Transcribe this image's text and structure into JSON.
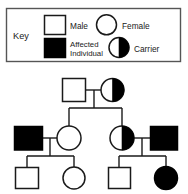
{
  "figure": {
    "type": "pedigree-chart",
    "title": "",
    "background_color": "#ffffff",
    "line_color": "#1a1a1a",
    "fill_affected_color": "#000000",
    "fill_unaffected_color": "#ffffff"
  },
  "key": {
    "label": "Key",
    "border_color": "#555555",
    "entries": [
      {
        "id": "male",
        "label": "Male",
        "symbol": "square",
        "fill": "none"
      },
      {
        "id": "female",
        "label": "Female",
        "symbol": "circle",
        "fill": "none"
      },
      {
        "id": "affected",
        "label_line1": "Affected",
        "label_line2": "Individual",
        "label": "Affected Individual",
        "symbol": "square",
        "fill": "full"
      },
      {
        "id": "carrier",
        "label": "Carrier",
        "symbol": "circle",
        "fill": "half-right"
      }
    ]
  },
  "pedigree": {
    "generations": [
      {
        "id": "I",
        "individuals": [
          {
            "id": "I-1",
            "sex": "male",
            "status": "unaffected",
            "symbol": "square",
            "fill": "none"
          },
          {
            "id": "I-2",
            "sex": "female",
            "status": "carrier",
            "symbol": "circle",
            "fill": "half-right"
          }
        ]
      },
      {
        "id": "II",
        "individuals": [
          {
            "id": "II-1",
            "sex": "male",
            "status": "affected",
            "symbol": "square",
            "fill": "full"
          },
          {
            "id": "II-2",
            "sex": "female",
            "status": "unaffected",
            "symbol": "circle",
            "fill": "none"
          },
          {
            "id": "II-3",
            "sex": "female",
            "status": "carrier",
            "symbol": "circle",
            "fill": "half-right"
          },
          {
            "id": "II-4",
            "sex": "male",
            "status": "affected",
            "symbol": "square",
            "fill": "full"
          }
        ]
      },
      {
        "id": "III",
        "individuals": [
          {
            "id": "III-1",
            "sex": "male",
            "status": "unaffected",
            "symbol": "square",
            "fill": "none"
          },
          {
            "id": "III-2",
            "sex": "female",
            "status": "unaffected",
            "symbol": "circle",
            "fill": "none"
          },
          {
            "id": "III-3",
            "sex": "male",
            "status": "unaffected",
            "symbol": "square",
            "fill": "none"
          },
          {
            "id": "III-4",
            "sex": "female",
            "status": "affected",
            "symbol": "circle",
            "fill": "full"
          }
        ]
      }
    ],
    "matings": [
      {
        "partners": [
          "I-1",
          "I-2"
        ],
        "children": [
          "II-2",
          "II-3"
        ]
      },
      {
        "partners": [
          "II-1",
          "II-2"
        ],
        "children": [
          "III-1",
          "III-2"
        ]
      },
      {
        "partners": [
          "II-3",
          "II-4"
        ],
        "children": [
          "III-3",
          "III-4"
        ]
      }
    ]
  }
}
